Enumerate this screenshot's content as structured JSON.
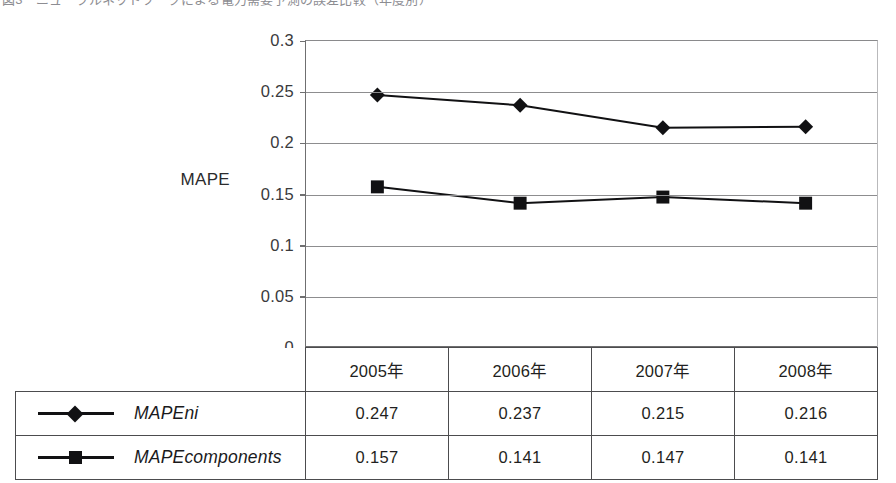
{
  "caption": {
    "text": "図3　ニューラルネットワークによる電力需要予測の誤差比較（年度別）"
  },
  "chart_data": {
    "type": "line",
    "title": "",
    "xlabel": "",
    "ylabel": "MAPE",
    "categories": [
      "2005年",
      "2006年",
      "2007年",
      "2008年"
    ],
    "ylim": [
      0,
      0.3
    ],
    "yticks": [
      "0",
      "0.05",
      "0.1",
      "0.15",
      "0.2",
      "0.25",
      "0.3"
    ],
    "ytick_values": [
      0,
      0.05,
      0.1,
      0.15,
      0.2,
      0.25,
      0.3
    ],
    "grid": "horizontal",
    "legend_position": "table-left-column",
    "series": [
      {
        "name": "MAPEni",
        "marker": "diamond",
        "color": "#111113",
        "values": [
          0.247,
          0.237,
          0.215,
          0.216
        ],
        "value_labels": [
          "0.247",
          "0.237",
          "0.215",
          "0.216"
        ]
      },
      {
        "name": "MAPEcomponents",
        "marker": "square",
        "color": "#111113",
        "values": [
          0.157,
          0.141,
          0.147,
          0.141
        ],
        "value_labels": [
          "0.157",
          "0.141",
          "0.147",
          "0.141"
        ]
      }
    ]
  },
  "axis": {
    "y_title": "MAPE"
  },
  "table": {
    "header": [
      "",
      "2005年",
      "2006年",
      "2007年",
      "2008年"
    ],
    "rows": [
      {
        "label": "MAPEni",
        "marker": "diamond",
        "cells": [
          "0.247",
          "0.237",
          "0.215",
          "0.216"
        ]
      },
      {
        "label": "MAPEcomponents",
        "marker": "square",
        "cells": [
          "0.157",
          "0.141",
          "0.147",
          "0.141"
        ]
      }
    ]
  },
  "colors": {
    "ink": "#111113",
    "grid": "#8d8d8f",
    "axis": "#6f6f70",
    "table_border": "#4c4c4e",
    "background": "#ffffff"
  }
}
